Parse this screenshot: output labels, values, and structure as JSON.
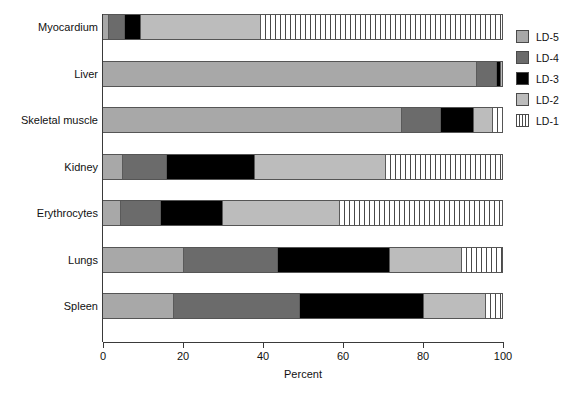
{
  "chart_data": {
    "type": "bar",
    "orientation": "horizontal",
    "stacked": true,
    "normalized": true,
    "title": "",
    "xlabel": "Percent",
    "ylabel": "",
    "xlim": [
      0,
      100
    ],
    "xticks": [
      0,
      20,
      40,
      60,
      80,
      100
    ],
    "grid": false,
    "legend_position": "right",
    "categories": [
      "Myocardium",
      "Liver",
      "Skeletal muscle",
      "Kidney",
      "Erythrocytes",
      "Lungs",
      "Spleen"
    ],
    "series": [
      {
        "name": "LD-5",
        "color": "#a8a8a8",
        "pattern": "solid",
        "values": [
          1.5,
          93.7,
          75.0,
          5.0,
          4.5,
          20.3,
          17.8
        ]
      },
      {
        "name": "LD-4",
        "color": "#6b6b6b",
        "pattern": "solid",
        "values": [
          4.0,
          5.0,
          9.8,
          11.0,
          10.0,
          23.5,
          31.5
        ]
      },
      {
        "name": "LD-3",
        "color": "#000000",
        "pattern": "solid",
        "values": [
          4.0,
          1.0,
          8.2,
          22.0,
          15.5,
          28.2,
          31.2
        ]
      },
      {
        "name": "LD-2",
        "color": "#bcbcbc",
        "pattern": "solid",
        "values": [
          30.0,
          0.3,
          4.8,
          33.0,
          29.5,
          18.0,
          15.5
        ]
      },
      {
        "name": "LD-1",
        "color": "#ffffff",
        "pattern": "vertical-stripes",
        "values": [
          60.5,
          0.0,
          2.2,
          29.0,
          40.5,
          10.0,
          4.0
        ]
      }
    ]
  },
  "legend": {
    "items": [
      {
        "label": "LD-5",
        "swatch": "ld5"
      },
      {
        "label": "LD-4",
        "swatch": "ld4"
      },
      {
        "label": "LD-3",
        "swatch": "ld3"
      },
      {
        "label": "LD-2",
        "swatch": "ld2"
      },
      {
        "label": "LD-1",
        "swatch": "ld1"
      }
    ]
  },
  "axis": {
    "x_title": "Percent",
    "tick_labels": [
      "0",
      "20",
      "40",
      "60",
      "80",
      "100"
    ]
  }
}
